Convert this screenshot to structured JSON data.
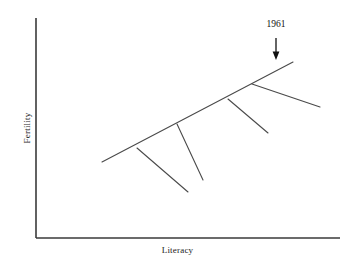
{
  "chart_data": {
    "type": "line",
    "title": "",
    "xlabel": "Literacy",
    "ylabel": "Fertility",
    "grid": false,
    "legend": null,
    "axis_ticks": {
      "x": [],
      "y": []
    },
    "annotations": [
      {
        "text": "1961",
        "label_x": 276,
        "label_y": 27,
        "arrow_from": [
          276,
          38
        ],
        "arrow_to": [
          276,
          60
        ],
        "points_to": "main-trend-line-right-end"
      }
    ],
    "axes": {
      "y_axis": {
        "x": 36,
        "y_top": 18,
        "y_bottom": 238
      },
      "x_axis": {
        "y": 238,
        "x_left": 36,
        "x_right": 340
      }
    },
    "series": [
      {
        "name": "main-trend-line",
        "kind": "main",
        "points": [
          [
            102,
            162
          ],
          [
            293,
            62
          ]
        ]
      },
      {
        "name": "branch-1",
        "kind": "branch",
        "points": [
          [
            137,
            148
          ],
          [
            188,
            192
          ]
        ]
      },
      {
        "name": "branch-2",
        "kind": "branch",
        "points": [
          [
            177,
            124
          ],
          [
            203,
            180
          ]
        ]
      },
      {
        "name": "branch-3",
        "kind": "branch",
        "points": [
          [
            228,
            99
          ],
          [
            268,
            133
          ]
        ]
      },
      {
        "name": "branch-4",
        "kind": "branch",
        "points": [
          [
            252,
            84
          ],
          [
            320,
            107
          ]
        ]
      }
    ]
  },
  "colors": {
    "background": "#ffffff",
    "axis": "#3a3a3a",
    "line": "#4a4a4a",
    "annotation": "#111111",
    "text": "#1a1a1a"
  }
}
